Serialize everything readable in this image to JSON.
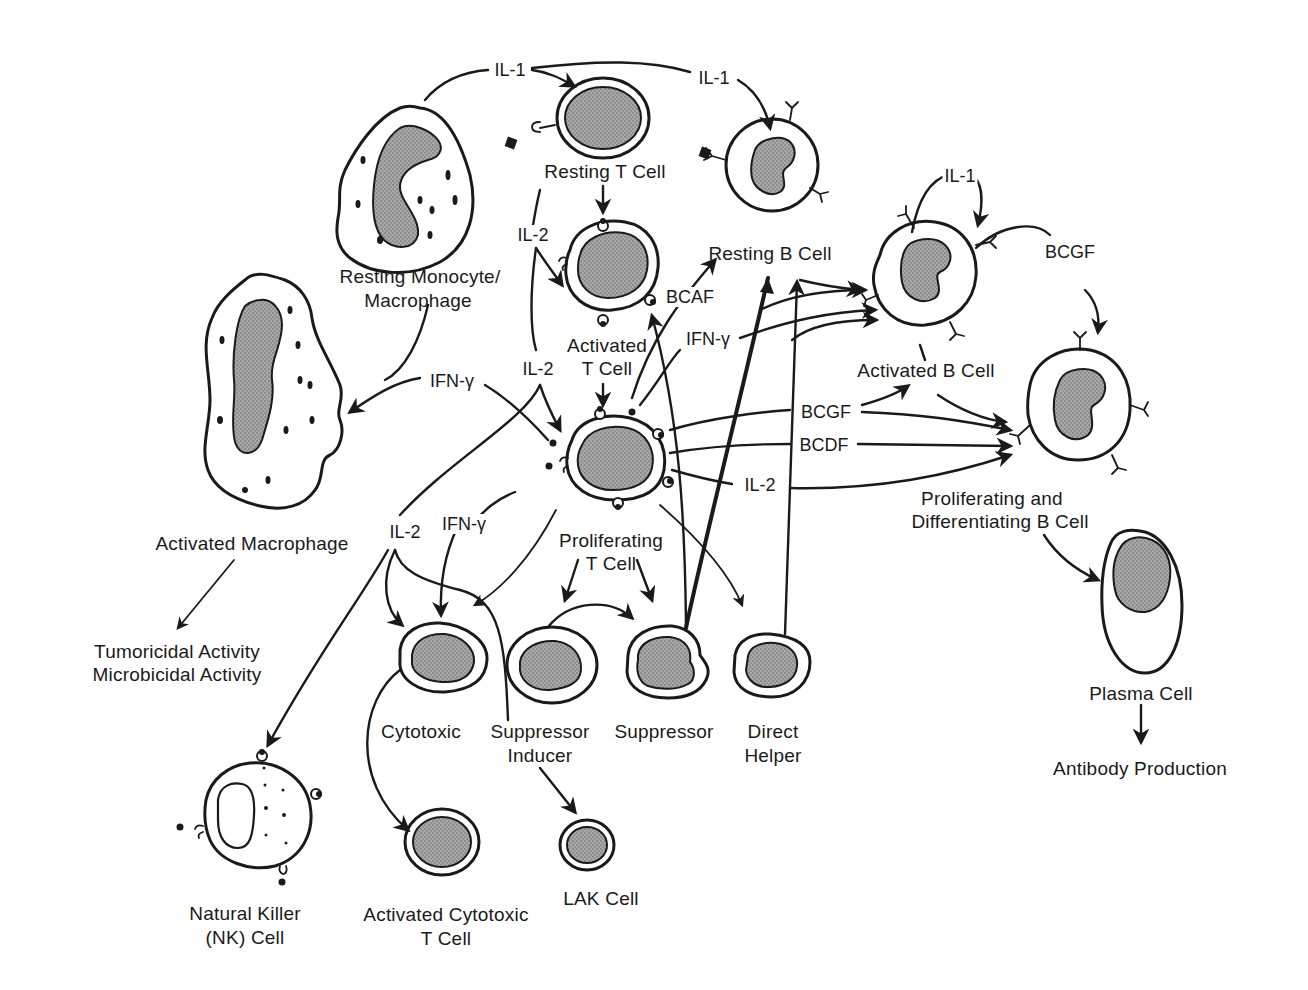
{
  "diagram": {
    "type": "immune-cell-interaction-network",
    "cells": {
      "resting_monocyte": "Resting Monocyte/\nMacrophage",
      "resting_monocyte_l1": "Resting Monocyte/",
      "resting_monocyte_l2": "Macrophage",
      "resting_t": "Resting T Cell",
      "resting_b": "Resting B Cell",
      "activated_t_l1": "Activated",
      "activated_t_l2": "T Cell",
      "activated_b": "Activated B Cell",
      "activated_macrophage": "Activated Macrophage",
      "proliferating_t_l1": "Proliferating",
      "proliferating_t_l2": "T Cell",
      "prolif_diff_b_l1": "Proliferating and",
      "prolif_diff_b_l2": "Differentiating B Cell",
      "cytotoxic": "Cytotoxic",
      "suppressor_inducer_l1": "Suppressor",
      "suppressor_inducer_l2": "Inducer",
      "suppressor": "Suppressor",
      "direct_helper_l1": "Direct",
      "direct_helper_l2": "Helper",
      "plasma": "Plasma Cell",
      "nk_l1": "Natural Killer",
      "nk_l2": "(NK) Cell",
      "activated_cytotoxic_l1": "Activated Cytotoxic",
      "activated_cytotoxic_l2": "T Cell",
      "lak": "LAK Cell"
    },
    "outcomes": {
      "tumoricidal": "Tumoricidal Activity",
      "microbicidal": "Microbicidal Activity",
      "antibody": "Antibody Production"
    },
    "factors": {
      "il1_a": "IL-1",
      "il1_b": "IL-1",
      "il1_c": "IL-1",
      "il2_a": "IL-2",
      "il2_b": "IL-2",
      "il2_c": "IL-2",
      "il2_d": "IL-2",
      "ifn_a": "IFN-γ",
      "ifn_b": "IFN-γ",
      "ifn_c": "IFN-γ",
      "bcaf": "BCAF",
      "bcgf_a": "BCGF",
      "bcgf_b": "BCGF",
      "bcdf": "BCDF"
    },
    "edges": [
      {
        "from": "Resting Monocyte/Macrophage",
        "to": "Resting T Cell",
        "label": "IL-1"
      },
      {
        "from": "Resting Monocyte/Macrophage",
        "to": "Resting B Cell",
        "label": "IL-1"
      },
      {
        "from": "Resting Monocyte/Macrophage",
        "to": "Activated Macrophage",
        "label": ""
      },
      {
        "from": "Resting T Cell",
        "to": "Activated T Cell",
        "label": ""
      },
      {
        "from": "Resting T Cell",
        "to": "Activated T Cell",
        "label": "IL-2"
      },
      {
        "from": "Activated T Cell",
        "to": "Proliferating T Cell",
        "label": "IL-2"
      },
      {
        "from": "Activated T Cell",
        "to": "Resting B Cell",
        "label": "BCAF"
      },
      {
        "from": "Activated T Cell",
        "to": "Activated B Cell",
        "label": "IFN-γ"
      },
      {
        "from": "Proliferating T Cell",
        "to": "Activated Macrophage",
        "label": "IFN-γ"
      },
      {
        "from": "Proliferating T Cell",
        "to": "Activated B Cell",
        "label": "BCGF"
      },
      {
        "from": "Proliferating T Cell",
        "to": "Proliferating and Differentiating B Cell",
        "label": "BCGF"
      },
      {
        "from": "Proliferating T Cell",
        "to": "Proliferating and Differentiating B Cell",
        "label": "BCDF"
      },
      {
        "from": "Proliferating T Cell",
        "to": "Proliferating and Differentiating B Cell",
        "label": "IL-2"
      },
      {
        "from": "Proliferating T Cell",
        "to": "Cytotoxic",
        "label": "IFN-γ"
      },
      {
        "from": "Proliferating T Cell",
        "to": "Cytotoxic",
        "label": "IL-2"
      },
      {
        "from": "Proliferating T Cell",
        "to": "Suppressor Inducer",
        "label": ""
      },
      {
        "from": "Proliferating T Cell",
        "to": "Suppressor",
        "label": ""
      },
      {
        "from": "Proliferating T Cell",
        "to": "Direct Helper",
        "label": ""
      },
      {
        "from": "IL-2",
        "to": "Natural Killer (NK) Cell",
        "label": "IL-2"
      },
      {
        "from": "Suppressor Inducer",
        "to": "Suppressor",
        "label": ""
      },
      {
        "from": "Suppressor",
        "to": "Activated T Cell",
        "label": ""
      },
      {
        "from": "Suppressor",
        "to": "Resting B Cell",
        "label": ""
      },
      {
        "from": "Direct Helper",
        "to": "Resting B Cell",
        "label": ""
      },
      {
        "from": "Cytotoxic",
        "to": "Activated Cytotoxic T Cell",
        "label": ""
      },
      {
        "from": "Suppressor Inducer",
        "to": "LAK Cell",
        "label": ""
      },
      {
        "from": "Resting B Cell",
        "to": "Activated B Cell",
        "label": ""
      },
      {
        "from": "Activated B Cell",
        "to": "Activated B Cell",
        "label": "IL-1"
      },
      {
        "from": "Activated B Cell",
        "to": "Proliferating and Differentiating B Cell",
        "label": "BCGF"
      },
      {
        "from": "Activated B Cell",
        "to": "Proliferating and Differentiating B Cell",
        "label": ""
      },
      {
        "from": "Activated Macrophage",
        "to": "Tumoricidal / Microbicidal Activity",
        "label": ""
      },
      {
        "from": "Proliferating and Differentiating B Cell",
        "to": "Plasma Cell",
        "label": ""
      },
      {
        "from": "Plasma Cell",
        "to": "Antibody Production",
        "label": ""
      }
    ],
    "colors": {
      "ink": "#1a1a1a",
      "nucleus_fill": "#9a9a9a",
      "background": "#ffffff"
    }
  }
}
